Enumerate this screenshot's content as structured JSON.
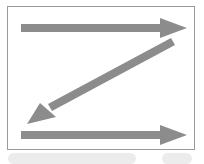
{
  "diagram": {
    "type": "z-pattern-reading-flow",
    "arrow_color": "#8c8c8c",
    "border_color": "#9a9a9a",
    "arrows": [
      {
        "name": "top-arrow",
        "direction": "left-to-right"
      },
      {
        "name": "diagonal-arrow",
        "direction": "top-right-to-bottom-left"
      },
      {
        "name": "bottom-arrow",
        "direction": "left-to-right"
      }
    ]
  }
}
